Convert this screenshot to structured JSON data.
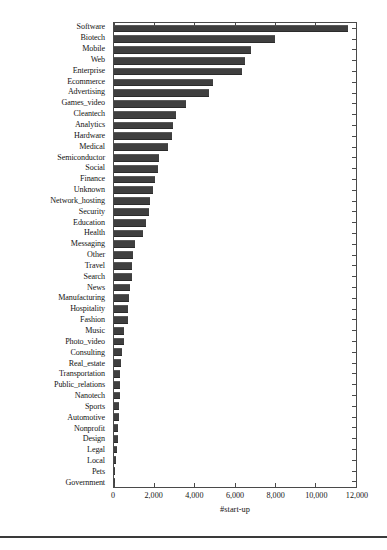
{
  "chart_data": {
    "type": "bar",
    "orientation": "horizontal",
    "title": "",
    "xlabel": "#start-up",
    "ylabel": "",
    "xlim": [
      0,
      12000
    ],
    "ylim": null,
    "grid": false,
    "legend": null,
    "xticks": [
      0,
      2000,
      4000,
      6000,
      8000,
      10000,
      12000
    ],
    "xticklabels": [
      "0",
      "2,000",
      "4,000",
      "6,000",
      "8,000",
      "10,000",
      "12,000"
    ],
    "bar_color": "#3f3f3f",
    "categories": [
      "Software",
      "Biotech",
      "Mobile",
      "Web",
      "Enterprise",
      "Ecommerce",
      "Advertising",
      "Games_video",
      "Cleantech",
      "Analytics",
      "Hardware",
      "Medical",
      "Semiconductor",
      "Social",
      "Finance",
      "Unknown",
      "Network_hosting",
      "Security",
      "Education",
      "Health",
      "Messaging",
      "Other",
      "Travel",
      "Search",
      "News",
      "Manufacturing",
      "Hospitality",
      "Fashion",
      "Music",
      "Photo_video",
      "Consulting",
      "Real_estate",
      "Transportation",
      "Public_relations",
      "Nanotech",
      "Sports",
      "Automotive",
      "Nonprofit",
      "Design",
      "Legal",
      "Local",
      "Pets",
      "Government"
    ],
    "values": [
      11600,
      8000,
      6800,
      6500,
      6350,
      4900,
      4700,
      3550,
      3050,
      2950,
      2900,
      2700,
      2250,
      2200,
      2050,
      1950,
      1800,
      1750,
      1600,
      1450,
      1050,
      950,
      900,
      880,
      800,
      760,
      700,
      680,
      520,
      500,
      400,
      330,
      320,
      300,
      290,
      260,
      230,
      200,
      180,
      130,
      90,
      60,
      20
    ]
  },
  "axis": {
    "x_title": "#start-up"
  },
  "footer": {
    "caption": ""
  }
}
